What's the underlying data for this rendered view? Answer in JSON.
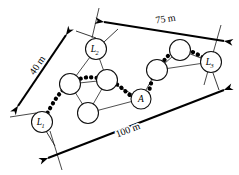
{
  "figure": {
    "background_color": "#ffffff",
    "line_color": "#111111",
    "route_color": "#000000"
  },
  "nodes": [
    {
      "id": "L1",
      "label": "L",
      "subscript": "1",
      "cx": 42,
      "cy": 122,
      "r": 10.5,
      "kind": "anchor"
    },
    {
      "id": "L2",
      "label": "L",
      "subscript": "2",
      "cx": 96,
      "cy": 49,
      "r": 10.5,
      "kind": "anchor"
    },
    {
      "id": "L3",
      "label": "L",
      "subscript": "3",
      "cx": 211,
      "cy": 62,
      "r": 10.5,
      "kind": "anchor"
    },
    {
      "id": "A",
      "label": "A",
      "subscript": "",
      "cx": 141,
      "cy": 99,
      "r": 10.0,
      "kind": "target"
    },
    {
      "id": "n1",
      "label": "",
      "subscript": "",
      "cx": 70,
      "cy": 84,
      "r": 10.5,
      "kind": "relay"
    },
    {
      "id": "n2",
      "label": "",
      "subscript": "",
      "cx": 107,
      "cy": 80,
      "r": 10.5,
      "kind": "relay"
    },
    {
      "id": "n3",
      "label": "",
      "subscript": "",
      "cx": 88,
      "cy": 113,
      "r": 10.5,
      "kind": "relay"
    },
    {
      "id": "n4",
      "label": "",
      "subscript": "",
      "cx": 157,
      "cy": 70,
      "r": 10.5,
      "kind": "relay"
    },
    {
      "id": "n5",
      "label": "",
      "subscript": "",
      "cx": 180,
      "cy": 50,
      "r": 10.5,
      "kind": "relay"
    }
  ],
  "mesh_links": [
    {
      "from": "L2",
      "to": "n1"
    },
    {
      "from": "L2",
      "to": "n2"
    },
    {
      "from": "n1",
      "to": "n2"
    },
    {
      "from": "n1",
      "to": "n3"
    },
    {
      "from": "n2",
      "to": "n3"
    },
    {
      "from": "n2",
      "to": "A"
    },
    {
      "from": "n3",
      "to": "A"
    },
    {
      "from": "A",
      "to": "n4"
    },
    {
      "from": "n4",
      "to": "n5"
    },
    {
      "from": "n5",
      "to": "L3"
    },
    {
      "from": "n4",
      "to": "L3"
    }
  ],
  "route": {
    "name": "multi-hop-route",
    "sequence": [
      "L1",
      "n1",
      "n2",
      "A",
      "n4",
      "n5",
      "L3"
    ]
  },
  "dimensions": [
    {
      "id": "dim-40",
      "label": "40 m",
      "value": 40,
      "unit": "m",
      "label_x": 40,
      "label_y": 67,
      "label_rotation": -56,
      "x1": 18,
      "y1": 106,
      "x2": 66,
      "y2": 35,
      "arrow_start": true,
      "arrow_end": true
    },
    {
      "id": "dim-75",
      "label": "75 m",
      "value": 75,
      "unit": "m",
      "label_x": 166,
      "label_y": 22,
      "label_rotation": -9,
      "x1": 104,
      "y1": 22,
      "x2": 224,
      "y2": 41,
      "arrow_start": true,
      "arrow_end": true
    },
    {
      "id": "dim-100",
      "label": "100 m",
      "value": 100,
      "unit": "m",
      "label_x": 129,
      "label_y": 133,
      "label_rotation": -21,
      "x1": 48,
      "y1": 158,
      "x2": 224,
      "y2": 90,
      "arrow_start": true,
      "arrow_end": true
    }
  ],
  "extension_lines": [
    {
      "id": "ext-L2",
      "x1": 99,
      "y1": 8,
      "x2": 92,
      "y2": 38
    },
    {
      "id": "ext-L3",
      "x1": 221,
      "y1": 25,
      "x2": 204,
      "y2": 85
    },
    {
      "id": "ext-L1-upper",
      "x1": 10,
      "y1": 117,
      "x2": 36,
      "y2": 113
    },
    {
      "id": "ext-L1-lower",
      "x1": 50,
      "y1": 131,
      "x2": 62,
      "y2": 170
    }
  ],
  "stub_lines": [
    {
      "id": "stub-L2-up",
      "x1": 96,
      "y1": 38,
      "x2": 76,
      "y2": 31
    },
    {
      "id": "stub-L2-right",
      "x1": 104,
      "y1": 42,
      "x2": 118,
      "y2": 29
    },
    {
      "id": "stub-L1-down",
      "x1": 46,
      "y1": 131,
      "x2": 55,
      "y2": 146
    },
    {
      "id": "stub-L3-down",
      "x1": 213,
      "y1": 73,
      "x2": 219,
      "y2": 90
    }
  ]
}
